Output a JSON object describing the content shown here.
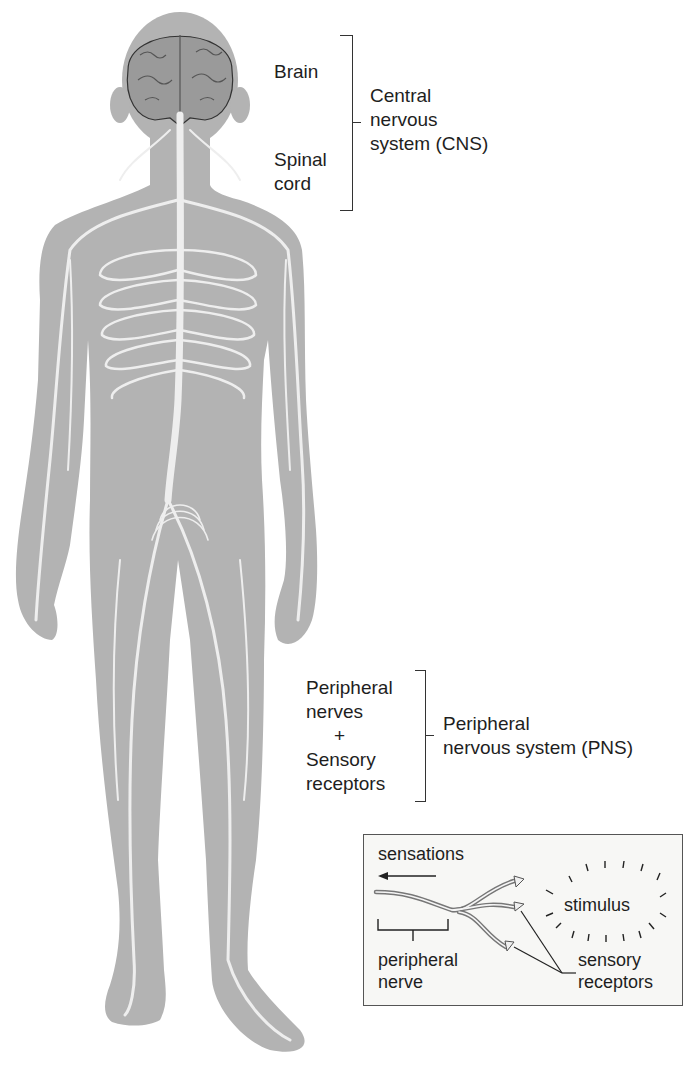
{
  "figure": {
    "colors": {
      "body": "#b3b3b3",
      "nerves": "#eeeeee",
      "brain": "#9a9a9a",
      "text": "#1e1e1e",
      "inset_bg": "#f7f7f5"
    }
  },
  "cns": {
    "parts": [
      "Brain",
      "Spinal",
      "cord"
    ],
    "brain_label": "Brain",
    "spinal_label_line1": "Spinal",
    "spinal_label_line2": "cord",
    "group_line1": "Central",
    "group_line2": "nervous",
    "group_line3": "system (CNS)"
  },
  "pns": {
    "item1_line1": "Peripheral",
    "item1_line2": "nerves",
    "plus": "+",
    "item2_line1": "Sensory",
    "item2_line2": "receptors",
    "group_line1": "Peripheral",
    "group_line2": "nervous system (PNS)"
  },
  "inset": {
    "sensations": "sensations",
    "stimulus": "stimulus",
    "peripheral_nerve_line1": "peripheral",
    "peripheral_nerve_line2": "nerve",
    "sensory_receptors_line1": "sensory",
    "sensory_receptors_line2": "receptors"
  }
}
